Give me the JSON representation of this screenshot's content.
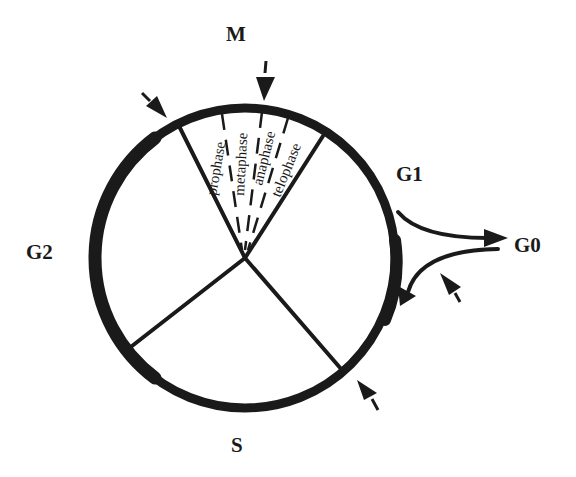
{
  "diagram": {
    "colors": {
      "ink": "#1a1a1a",
      "background": "#ffffff"
    },
    "phases": [
      {
        "id": "M",
        "label": "M"
      },
      {
        "id": "G1",
        "label": "G1"
      },
      {
        "id": "G0",
        "label": "G0"
      },
      {
        "id": "G2",
        "label": "G2"
      },
      {
        "id": "S",
        "label": "S"
      }
    ],
    "mitosis_subphases": [
      {
        "label": "prophase"
      },
      {
        "label": "metaphase"
      },
      {
        "label": "anaphase"
      },
      {
        "label": "telophase"
      }
    ],
    "checkpoint_arrows": [
      {
        "name": "M-G2 boundary checkpoint"
      },
      {
        "name": "metaphase checkpoint"
      },
      {
        "name": "G0 return checkpoint"
      },
      {
        "name": "G1-S boundary checkpoint"
      }
    ],
    "transitions": [
      {
        "from": "G1",
        "to": "G0"
      },
      {
        "from": "G0",
        "to": "G1"
      }
    ]
  }
}
